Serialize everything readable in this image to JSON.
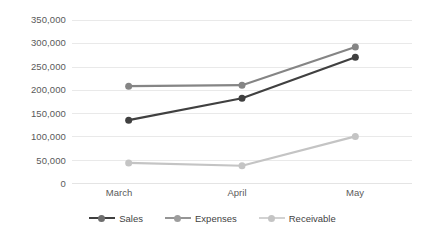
{
  "chart_data": {
    "type": "line",
    "title": "",
    "subtitle": "",
    "xlabel": "",
    "ylabel": "",
    "categories": [
      "March",
      "April",
      "May"
    ],
    "series": [
      {
        "name": "Sales",
        "values": [
          135000,
          182000,
          270000
        ],
        "color": "#404040"
      },
      {
        "name": "Expenses",
        "values": [
          208000,
          210000,
          292000
        ],
        "color": "#858585"
      },
      {
        "name": "Receivable",
        "values": [
          43000,
          37000,
          100000
        ],
        "color": "#c4c4c4"
      }
    ],
    "ylim": [
      0,
      350000
    ],
    "ytick_step": 50000,
    "ytick_labels": [
      "0",
      "50,000",
      "100,000",
      "150,000",
      "200,000",
      "250,000",
      "300,000",
      "350,000"
    ],
    "ytick_values": [
      0,
      50000,
      100000,
      150000,
      200000,
      250000,
      300000,
      350000
    ],
    "grid": true,
    "grid_axis": "y",
    "grid_color": "#e9e9e9",
    "legend_position": "bottom",
    "marker": "circle",
    "marker_size": 7,
    "line_width": 2.2,
    "background": "#ffffff",
    "axis_label_color": "#5a5a5a"
  },
  "legend": {
    "items": [
      {
        "label": "Sales"
      },
      {
        "label": "Expenses"
      },
      {
        "label": "Receivable"
      }
    ]
  }
}
